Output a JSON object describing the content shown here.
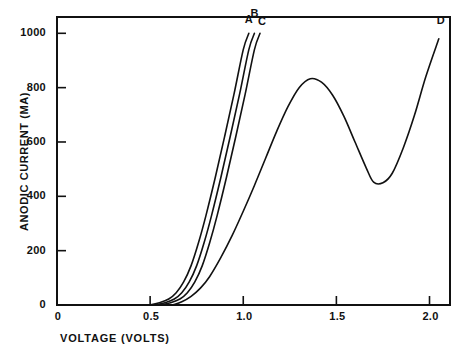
{
  "chart_data": {
    "type": "line",
    "title": "",
    "xlabel": "VOLTAGE (VOLTS)",
    "ylabel": "ANODIC CURRENT (MA)",
    "xlim": [
      0,
      2.11
    ],
    "ylim": [
      0,
      1060
    ],
    "xticks": [
      0,
      0.5,
      1.0,
      1.5,
      2.0
    ],
    "xticklabels": [
      "0",
      "0.5",
      "1.0",
      "1.5",
      "2.0"
    ],
    "yticks": [
      0,
      200,
      400,
      600,
      800,
      1000
    ],
    "yticklabels": [
      "0",
      "200",
      "400",
      "600",
      "800",
      "1000"
    ],
    "grid": false,
    "legend": "inline-end-labels",
    "line_color": "#111111",
    "background_color": "#ffffff",
    "series": [
      {
        "name": "A",
        "label": "A",
        "x": [
          0.5,
          0.55,
          0.6,
          0.64,
          0.68,
          0.72,
          0.76,
          0.8,
          0.85,
          0.9,
          0.95,
          1.0,
          1.03
        ],
        "y": [
          0,
          8,
          22,
          45,
          85,
          145,
          230,
          330,
          470,
          620,
          775,
          940,
          1000
        ]
      },
      {
        "name": "B",
        "label": "B",
        "x": [
          0.53,
          0.58,
          0.63,
          0.67,
          0.71,
          0.75,
          0.79,
          0.83,
          0.88,
          0.93,
          0.98,
          1.03,
          1.06
        ],
        "y": [
          0,
          8,
          22,
          45,
          85,
          145,
          230,
          330,
          470,
          620,
          775,
          940,
          1000
        ]
      },
      {
        "name": "C",
        "label": "C",
        "x": [
          0.56,
          0.61,
          0.66,
          0.7,
          0.74,
          0.78,
          0.82,
          0.86,
          0.91,
          0.96,
          1.01,
          1.06,
          1.09
        ],
        "y": [
          0,
          8,
          22,
          45,
          85,
          145,
          230,
          330,
          470,
          620,
          775,
          940,
          1000
        ]
      },
      {
        "name": "D",
        "label": "D",
        "x": [
          0.62,
          0.67,
          0.72,
          0.77,
          0.82,
          0.88,
          0.94,
          1.0,
          1.06,
          1.12,
          1.18,
          1.24,
          1.3,
          1.36,
          1.42,
          1.48,
          1.54,
          1.6,
          1.66,
          1.7,
          1.75,
          1.8,
          1.86,
          1.92,
          1.98,
          2.05
        ],
        "y": [
          0,
          12,
          32,
          62,
          105,
          175,
          255,
          345,
          440,
          540,
          640,
          730,
          800,
          833,
          820,
          772,
          695,
          600,
          505,
          452,
          450,
          485,
          580,
          700,
          840,
          980
        ]
      }
    ],
    "annotations": [
      {
        "text": "A",
        "x": 1.03,
        "y": 1050
      },
      {
        "text": "B",
        "x": 1.06,
        "y": 1070
      },
      {
        "text": "C",
        "x": 1.1,
        "y": 1040
      },
      {
        "text": "D",
        "x": 2.06,
        "y": 1045
      }
    ]
  }
}
